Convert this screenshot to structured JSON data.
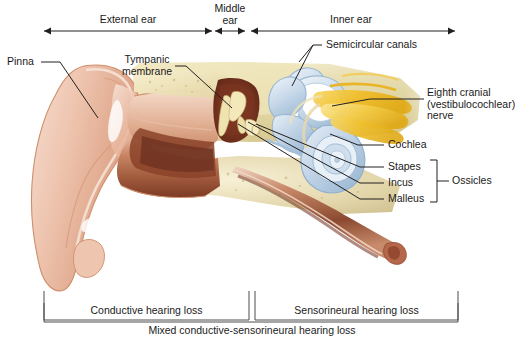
{
  "figure": {
    "background": "#ffffff",
    "line_color": "#231f20",
    "text_color": "#1a1a1a"
  },
  "top_scale": {
    "segments": [
      {
        "label": "External ear",
        "x_start": 44,
        "x_end": 212,
        "label_x": 128,
        "label_y": 16
      },
      {
        "label": "Middle\near",
        "x_start": 212,
        "x_end": 248,
        "label_x": 230,
        "label_y": 5
      },
      {
        "label": "Inner ear",
        "x_start": 248,
        "x_end": 455,
        "label_x": 351,
        "label_y": 16
      }
    ],
    "axis_y": 31
  },
  "callouts": {
    "pinna": {
      "label": "Pinna",
      "x": 8,
      "y": 58
    },
    "tympanic_membrane": {
      "label": "Tympanic\nmembrane",
      "x": 117,
      "y": 55
    },
    "semicircular_canals": {
      "label": "Semicircular canals",
      "x": 326,
      "y": 41
    },
    "eighth_cranial_nerve": {
      "label": "Eighth cranial\n(vestibulocochlear)\nnerve",
      "x": 427,
      "y": 88
    },
    "cochlea": {
      "label": "Cochlea",
      "x": 387,
      "y": 141
    },
    "stapes": {
      "label": "Stapes",
      "x": 387,
      "y": 163
    },
    "incus": {
      "label": "Incus",
      "x": 387,
      "y": 179
    },
    "malleus": {
      "label": "Malleus",
      "x": 387,
      "y": 195
    },
    "ossicles": {
      "label": "Ossicles",
      "x": 452,
      "y": 179
    }
  },
  "bottom_brackets": {
    "conductive": {
      "label": "Conductive hearing loss",
      "x_start": 44,
      "x_end": 249,
      "label_x": 146,
      "label_y": 311
    },
    "sensorineural": {
      "label": "Sensorineural hearing loss",
      "x_start": 255,
      "x_end": 458,
      "label_x": 356,
      "label_y": 311
    },
    "mixed": {
      "label": "Mixed conductive-sensorineural hearing loss",
      "x_start": 44,
      "x_end": 458,
      "label_x": 251,
      "label_y": 329
    }
  },
  "anatomy_colors": {
    "skin_light": "#f2d2c0",
    "skin_mid": "#e7b69c",
    "skin_dark": "#cf8f72",
    "cartilage_outline": "#c98b6a",
    "canal_dark": "#7a3b2a",
    "canal_mid": "#9e4f35",
    "bone_tan": "#e8dfb4",
    "bone_tan_dark": "#d2c48a",
    "cochlea_blue": "#c5d6e8",
    "cochlea_blue_dark": "#93b2cd",
    "nerve_yellow": "#f2c233",
    "nerve_yellow_dark": "#d9a518",
    "membrane_cream": "#f6eccb"
  }
}
